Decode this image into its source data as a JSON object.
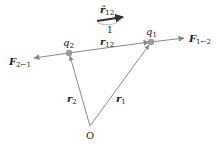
{
  "diagram": {
    "unit_vector": {
      "symbol": "r̂",
      "subscript": "12",
      "magnitude_label": "1"
    },
    "charges": [
      {
        "id": "q1",
        "symbol": "q",
        "subscript": "1",
        "x": 151,
        "y": 42
      },
      {
        "id": "q2",
        "symbol": "q",
        "subscript": "2",
        "x": 69,
        "y": 53
      }
    ],
    "separation_vector": {
      "symbol": "r",
      "subscript": "12"
    },
    "position_vectors": [
      {
        "symbol": "r",
        "subscript": "1"
      },
      {
        "symbol": "r",
        "subscript": "2"
      }
    ],
    "origin": {
      "label": "O",
      "x": 90,
      "y": 126
    },
    "forces": [
      {
        "symbol": "F",
        "subscript": "1←2"
      },
      {
        "symbol": "F",
        "subscript": "2←1"
      }
    ],
    "colors": {
      "line": "#8a8a8a",
      "dark_arrow": "#333333",
      "charge": "#9a9a9a"
    }
  }
}
